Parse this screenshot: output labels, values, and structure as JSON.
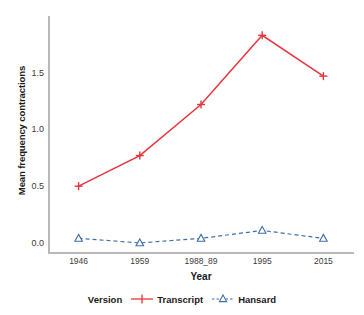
{
  "chart_data": {
    "type": "line",
    "title": "",
    "xlabel": "Year",
    "ylabel": "Mean frequency contractions",
    "categories": [
      "1946",
      "1959",
      "1988_89",
      "1995",
      "2015"
    ],
    "yticks": [
      "0.0",
      "0.5",
      "1.0",
      "1.5"
    ],
    "ytick_values": [
      0.0,
      0.5,
      1.0,
      1.5
    ],
    "ylim": [
      -0.08,
      2.0
    ],
    "grid": false,
    "legend_position": "bottom",
    "legend_title": "Version",
    "series": [
      {
        "name": "Transcript",
        "color": "#e8343c",
        "marker": "plus",
        "linestyle": "solid",
        "values": [
          0.5,
          0.77,
          1.22,
          1.83,
          1.47
        ]
      },
      {
        "name": "Hansard",
        "color": "#3f6fa8",
        "marker": "triangle",
        "linestyle": "dashed",
        "values": [
          0.04,
          0.0,
          0.04,
          0.11,
          0.04
        ]
      }
    ]
  },
  "axis": {
    "y_title": "Mean frequency contractions",
    "x_title": "Year"
  },
  "legend": {
    "title": "Version",
    "entries": [
      {
        "label": "Transcript",
        "color": "#e8343c"
      },
      {
        "label": "Hansard",
        "color": "#3f6fa8"
      }
    ]
  }
}
